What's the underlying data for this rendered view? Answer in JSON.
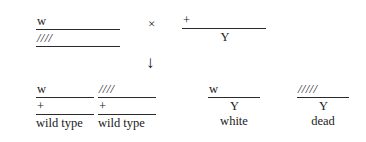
{
  "figure": {
    "type": "genetic-cross-diagram",
    "cross_symbol": "×",
    "arrow_symbol": "↓",
    "parents": [
      {
        "id": "maternal-parent",
        "top_allele": "w",
        "bottom_allele": "////",
        "label": ""
      },
      {
        "id": "paternal-parent",
        "top_allele": "+",
        "bottom_allele": "Y",
        "label": ""
      }
    ],
    "offspring": [
      {
        "id": "offspring-1",
        "top_allele": "w",
        "bottom_allele": "+",
        "label": "wild type"
      },
      {
        "id": "offspring-2",
        "top_allele": "////",
        "bottom_allele": "+",
        "label": "wild type"
      },
      {
        "id": "offspring-3",
        "top_allele": "w",
        "bottom_allele": "Y",
        "label": "white"
      },
      {
        "id": "offspring-4",
        "top_allele": "/////",
        "bottom_allele": "Y",
        "label": "dead"
      }
    ]
  }
}
